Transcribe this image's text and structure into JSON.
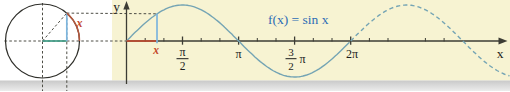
{
  "figure": {
    "axis_labels": {
      "x": "x",
      "y": "y"
    },
    "function_label": "f(x) = sin x",
    "circle_angle_label": "x",
    "graph_arc_label": "x",
    "tick_labels": {
      "half_pi_numerator": "π",
      "half_pi_denominator": "2",
      "pi": "π",
      "three_halves_numerator": "3",
      "three_halves_denominator": "2",
      "three_halves_pi_symbol": "π",
      "two_pi": "2π"
    },
    "colors": {
      "panel_background": "#f7f3d2",
      "bottom_strip": "#d2d2d2",
      "curve": "#74a4b4",
      "axis": "#3c3c34",
      "red_accent": "#c4492c",
      "arc_red": "#b2573c",
      "sine_segment_blue": "#7db5dd",
      "cosine_segment_teal": "#3f9b85",
      "function_label_blue": "#2d6cb5"
    }
  },
  "chart_data": {
    "type": "line",
    "title": "f(x) = sin x",
    "function": "sin(x)",
    "xlabel": "x",
    "ylabel": "y",
    "x_domain_radians": [
      0,
      10.75
    ],
    "solid_domain_radians": [
      0,
      6.2832
    ],
    "dashed_domain_radians": [
      6.2832,
      10.75
    ],
    "amplitude": 1,
    "grid": false,
    "x_ticks_major": [
      {
        "x_pi": 0.5,
        "label": "π/2"
      },
      {
        "x_pi": 1.0,
        "label": "π"
      },
      {
        "x_pi": 1.5,
        "label": "3/2 π"
      },
      {
        "x_pi": 2.0,
        "label": "2π"
      }
    ],
    "minor_tick_step": "π/6",
    "key_points_x_pi": [
      0,
      0.5,
      1,
      1.5,
      2,
      2.5,
      3
    ],
    "key_points_y": [
      0,
      1,
      0,
      -1,
      0,
      1,
      0
    ],
    "marked_point": {
      "x_radians": 0.855,
      "y": 0.754,
      "x_axis_label": "x"
    },
    "unit_circle": {
      "radius": 1,
      "angle_radians": 0.855,
      "arc_label": "x"
    }
  }
}
